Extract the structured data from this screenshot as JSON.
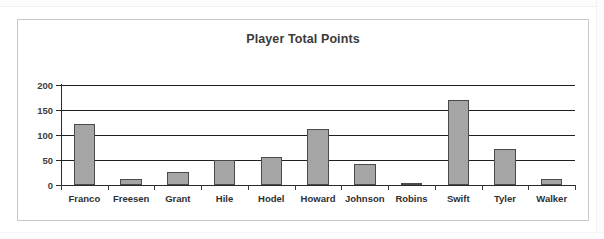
{
  "chart_data": {
    "type": "bar",
    "title": "Player Total Points",
    "xlabel": "",
    "ylabel": "",
    "categories": [
      "Franco",
      "Freesen",
      "Grant",
      "Hile",
      "Hodel",
      "Howard",
      "Johnson",
      "Robins",
      "Swift",
      "Tyler",
      "Walker"
    ],
    "values": [
      123,
      12,
      27,
      50,
      57,
      112,
      42,
      5,
      170,
      72,
      13
    ],
    "ylim": [
      0,
      200
    ],
    "yticks": [
      0,
      50,
      100,
      150,
      200
    ],
    "ytick_labels": [
      "0",
      "50",
      "100",
      "150",
      "200"
    ],
    "grid": true,
    "legend": false,
    "bar_color": "#a5a5a5",
    "bar_border_color": "#4a4a4a",
    "gridline_color": "#1f1f1f",
    "title_color": "#3b3b3b",
    "frame_border_color": "#c9c9c9",
    "background_color": "#ffffff"
  }
}
